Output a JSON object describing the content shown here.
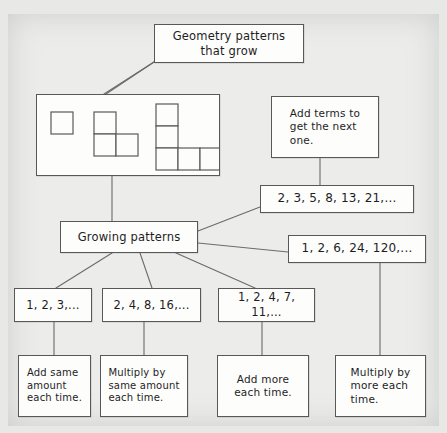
{
  "diagram": {
    "title_node": "Geometry patterns\nthat grow",
    "add_terms_node": "Add terms to\nget the next\none.",
    "fibonacci_sequence": "2, 3, 5, 8, 13, 21,...",
    "factorial_sequence": "1, 2, 6, 24, 120,...",
    "growing_patterns_node": "Growing patterns",
    "sequence_counting": "1, 2, 3,...",
    "sequence_doubling": "2, 4, 8, 16,...",
    "sequence_triangular": "1, 2, 4, 7, 11,...",
    "rule_add_same": "Add same\namount\neach time.",
    "rule_multiply_same": "Multiply by\nsame amount\neach time.",
    "rule_add_more": "Add more\neach time.",
    "rule_multiply_more": "Multiply by\nmore each\ntime.",
    "shapes_caption": "growing L-shaped square pattern: 1 square, 3 squares, 5 squares",
    "colors": {
      "paper": "#ececeb",
      "box_fill": "#fdfdfc",
      "ink": "#1d1d1f",
      "border": "#58585a",
      "connector": "#6b6b6d"
    }
  }
}
